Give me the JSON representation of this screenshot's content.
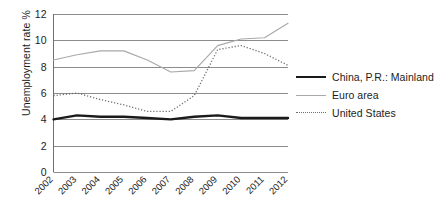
{
  "chart_data": {
    "type": "line",
    "title": "",
    "xlabel": "",
    "ylabel": "Unemployment rate %",
    "categories": [
      "2002",
      "2003",
      "2004",
      "2005",
      "2006",
      "2007",
      "2008",
      "2009",
      "2010",
      "2011",
      "2012"
    ],
    "x": [
      2002,
      2003,
      2004,
      2005,
      2006,
      2007,
      2008,
      2009,
      2010,
      2011,
      2012
    ],
    "ylim": [
      0,
      12
    ],
    "yticks": [
      0,
      2,
      4,
      6,
      8,
      10,
      12
    ],
    "ytick_labels": [
      "0",
      "2",
      "4",
      "6",
      "8",
      "10",
      "12"
    ],
    "grid": "horizontal",
    "legend_position": "right",
    "series": [
      {
        "name": "China, P.R.: Mainland",
        "style": "solid-thick",
        "color": "#1a1a1a",
        "values": [
          4.0,
          4.3,
          4.2,
          4.2,
          4.1,
          4.0,
          4.2,
          4.3,
          4.1,
          4.1,
          4.1
        ]
      },
      {
        "name": "Euro area",
        "style": "solid-thin",
        "color": "#a8a8a8",
        "values": [
          8.5,
          8.9,
          9.2,
          9.2,
          8.5,
          7.6,
          7.7,
          9.6,
          10.1,
          10.2,
          11.3
        ]
      },
      {
        "name": "United States",
        "style": "dotted",
        "color": "#6e6e6e",
        "values": [
          5.8,
          6.0,
          5.5,
          5.1,
          4.6,
          4.6,
          5.8,
          9.3,
          9.6,
          9.0,
          8.1
        ]
      }
    ]
  },
  "legend": {
    "items": [
      {
        "label": "China, P.R.: Mainland"
      },
      {
        "label": "Euro area"
      },
      {
        "label": "United States"
      }
    ]
  },
  "axes": {
    "y_title": "Unemployment rate %"
  },
  "colors": {
    "grid": "#8c8c8c",
    "axis": "#6f6f6f",
    "text": "#1c1c1c",
    "background": "#ffffff"
  }
}
